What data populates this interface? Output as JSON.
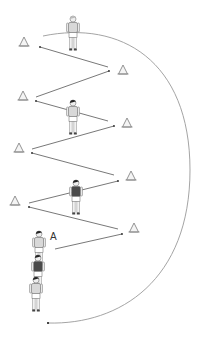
{
  "diagram": {
    "title": "",
    "colors": {
      "line": "#555555",
      "arc": "#9a9a9a",
      "cone": "#888888",
      "player_light": "#d8d8d8",
      "player_dark": "#4a4a4a"
    },
    "labels": [
      {
        "id": "player-a-label",
        "text": "A",
        "x": 50,
        "y": 231
      }
    ],
    "cones": [
      {
        "x": 24,
        "y": 42
      },
      {
        "x": 123,
        "y": 70
      },
      {
        "x": 23,
        "y": 96
      },
      {
        "x": 127,
        "y": 123
      },
      {
        "x": 19,
        "y": 148
      },
      {
        "x": 131,
        "y": 176
      },
      {
        "x": 15,
        "y": 201
      },
      {
        "x": 134,
        "y": 228
      }
    ],
    "paths": [
      {
        "from": [
          55,
          249
        ],
        "to": [
          122,
          234
        ]
      },
      {
        "from": [
          118,
          229
        ],
        "to": [
          29,
          207
        ]
      },
      {
        "from": [
          29,
          203
        ],
        "to": [
          118,
          181
        ]
      },
      {
        "from": [
          114,
          175
        ],
        "to": [
          32,
          153
        ]
      },
      {
        "from": [
          32,
          149
        ],
        "to": [
          114,
          126
        ]
      },
      {
        "from": [
          108,
          121
        ],
        "to": [
          36,
          101
        ]
      },
      {
        "from": [
          36,
          97
        ],
        "to": [
          109,
          71
        ]
      },
      {
        "from": [
          108,
          67
        ],
        "to": [
          40,
          47
        ]
      }
    ],
    "return_arc": {
      "start": [
        43,
        36
      ],
      "end": [
        48,
        323
      ]
    },
    "players": [
      {
        "id": "player-top",
        "x": 73,
        "y": 16,
        "shade": "light",
        "facing": "front"
      },
      {
        "id": "player-mid-1",
        "x": 73,
        "y": 100,
        "shade": "light",
        "facing": "back-dark-hair"
      },
      {
        "id": "player-mid-2",
        "x": 76,
        "y": 180,
        "shade": "dark",
        "facing": "back"
      },
      {
        "id": "player-a",
        "x": 39,
        "y": 231,
        "shade": "light",
        "facing": "side"
      },
      {
        "id": "player-queue-2",
        "x": 38,
        "y": 255,
        "shade": "dark",
        "facing": "back"
      },
      {
        "id": "player-queue-3",
        "x": 36,
        "y": 277,
        "shade": "light",
        "facing": "back"
      }
    ]
  }
}
